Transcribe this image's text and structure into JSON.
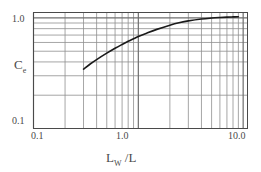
{
  "chart_data": {
    "type": "line",
    "title": "",
    "subtitle": "",
    "xlabel": "Lw /L",
    "xlabel_main": "L",
    "xlabel_sub": "W",
    "xlabel_tail": " /L",
    "ylabel": "Ce",
    "ylabel_main": "C",
    "ylabel_sub": "e",
    "xscale": "log",
    "yscale": "log",
    "xlim": [
      0.1,
      11.0
    ],
    "ylim": [
      0.1,
      1.12
    ],
    "grid": true,
    "grid_minor": true,
    "legend": "none",
    "xticks": [
      0.1,
      1.0,
      10.0
    ],
    "xticklabels": [
      "0.1",
      "1.0",
      "10.0"
    ],
    "yticks": [
      0.1,
      1.0
    ],
    "yticklabels": [
      "0.1",
      "1.0"
    ],
    "series": [
      {
        "name": "Ce curve",
        "x": [
          0.3,
          0.35,
          0.4,
          0.5,
          0.6,
          0.7,
          0.8,
          0.9,
          1.0,
          1.2,
          1.5,
          2.0,
          2.5,
          3.0,
          4.0,
          5.0,
          6.0,
          7.0,
          8.0,
          9.0
        ],
        "y": [
          0.345,
          0.385,
          0.42,
          0.48,
          0.532,
          0.576,
          0.615,
          0.648,
          0.678,
          0.728,
          0.788,
          0.86,
          0.908,
          0.94,
          0.978,
          0.998,
          1.01,
          1.018,
          1.022,
          1.025
        ]
      }
    ],
    "colors": {
      "curve": "#1a1a1a",
      "grid_major": "#6e6e6e",
      "grid_minor": "#8f8f8f",
      "frame": "#4a4a4a",
      "text": "#4a4a4a",
      "background": "#ffffff"
    }
  }
}
